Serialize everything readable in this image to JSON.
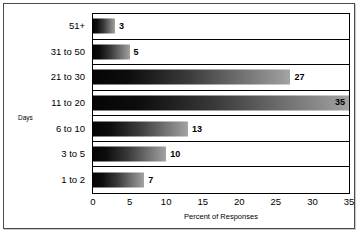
{
  "chart_data": {
    "type": "bar",
    "orientation": "horizontal",
    "title": "",
    "xlabel": "Percent of Responses",
    "ylabel": "Days",
    "categories": [
      "1 to 2",
      "3 to 5",
      "6 to 10",
      "11 to 20",
      "21 to 30",
      "31 to 50",
      "51+"
    ],
    "values": [
      7,
      10,
      13,
      35,
      27,
      5,
      3
    ],
    "display_order_top_to_bottom": [
      "51+",
      "31 to 50",
      "21 to 30",
      "11 to 20",
      "6 to 10",
      "3 to 5",
      "1 to 2"
    ],
    "values_top_to_bottom": [
      3,
      5,
      27,
      35,
      13,
      10,
      7
    ],
    "xlim": [
      0,
      35
    ],
    "xticks": [
      0,
      5,
      10,
      15,
      20,
      25,
      30,
      35
    ],
    "xtick_labels": [
      "0",
      "5",
      "10",
      "15",
      "20",
      "25",
      "30",
      "35"
    ],
    "data_labels": [
      "3",
      "5",
      "27",
      "35",
      "13",
      "10",
      "7"
    ],
    "grid": "horizontal-row-separators",
    "legend": "none",
    "bar_gradient_start": "#050505",
    "bar_gradient_end": "#a5a5a5",
    "axis_color": "#000000",
    "frame_color": "#4a4a4a",
    "background": "#ffffff"
  },
  "rows": [
    {
      "category": "51+",
      "value": 3,
      "label": "3",
      "label_position": "outside"
    },
    {
      "category": "31 to 50",
      "value": 5,
      "label": "5",
      "label_position": "outside"
    },
    {
      "category": "21 to 30",
      "value": 27,
      "label": "27",
      "label_position": "outside"
    },
    {
      "category": "11 to 20",
      "value": 35,
      "label": "35",
      "label_position": "inside"
    },
    {
      "category": "6 to 10",
      "value": 13,
      "label": "13",
      "label_position": "outside"
    },
    {
      "category": "3 to 5",
      "value": 10,
      "label": "10",
      "label_position": "outside"
    },
    {
      "category": "1 to 2",
      "value": 7,
      "label": "7",
      "label_position": "outside"
    }
  ],
  "axes": {
    "y_title": "Days",
    "x_title": "Percent of Responses",
    "x_ticks": [
      {
        "value": 0,
        "label": "0"
      },
      {
        "value": 5,
        "label": "5"
      },
      {
        "value": 10,
        "label": "10"
      },
      {
        "value": 15,
        "label": "15"
      },
      {
        "value": 20,
        "label": "20"
      },
      {
        "value": 25,
        "label": "25"
      },
      {
        "value": 30,
        "label": "30"
      },
      {
        "value": 35,
        "label": "35"
      }
    ]
  }
}
